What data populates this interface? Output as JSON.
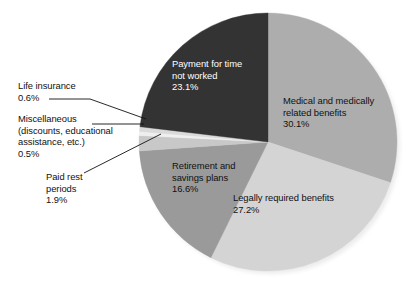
{
  "chart_data": {
    "type": "pie",
    "title": "",
    "xlabel": "",
    "ylabel": "",
    "unit": "%",
    "legend_position": "none",
    "grid": false,
    "start_angle_deg": 0,
    "direction": "clockwise",
    "categories": [
      "Medical and medically related benefits",
      "Legally required benefits",
      "Retirement and savings plans",
      "Paid rest periods",
      "Miscellaneous (discounts, educational assistance, etc.)",
      "Life insurance",
      "Payment for time not worked"
    ],
    "values": [
      30.1,
      27.2,
      16.6,
      1.9,
      0.5,
      0.6,
      23.1
    ],
    "colors": [
      "#adadad",
      "#d4d4d4",
      "#9a9a9a",
      "#c8c8c8",
      "#efefef",
      "#dadada",
      "#333333"
    ],
    "slices": [
      {
        "label": "Medical and medically related benefits",
        "value": 30.1,
        "value_text": "30.1%",
        "color": "#adadad",
        "label_placement": "inside"
      },
      {
        "label": "Legally required benefits",
        "value": 27.2,
        "value_text": "27.2%",
        "color": "#d4d4d4",
        "label_placement": "inside"
      },
      {
        "label": "Retirement and savings plans",
        "value": 16.6,
        "value_text": "16.6%",
        "color": "#9a9a9a",
        "label_placement": "inside"
      },
      {
        "label": "Paid rest periods",
        "value": 1.9,
        "value_text": "1.9%",
        "color": "#c8c8c8",
        "label_placement": "callout"
      },
      {
        "label": "Miscellaneous (discounts, educational assistance, etc.)",
        "value": 0.5,
        "value_text": "0.5%",
        "color": "#efefef",
        "label_placement": "callout"
      },
      {
        "label": "Life insurance",
        "value": 0.6,
        "value_text": "0.6%",
        "color": "#dadada",
        "label_placement": "callout"
      },
      {
        "label": "Payment for time not worked",
        "value": 23.1,
        "value_text": "23.1%",
        "color": "#333333",
        "label_placement": "inside"
      }
    ]
  },
  "labels": {
    "life_insurance": "Life insurance\n0.6%",
    "miscellaneous": "Miscellaneous\n(discounts, educational\nassistance, etc.)\n0.5%",
    "paid_rest": "Paid rest\nperiods\n1.9%",
    "payment_time": "Payment for time\nnot worked\n23.1%",
    "medical": "Medical and medically\nrelated benefits\n30.1%",
    "legally_required": "Legally required benefits\n27.2%",
    "retirement": "Retirement and\nsavings plans\n16.6%"
  }
}
